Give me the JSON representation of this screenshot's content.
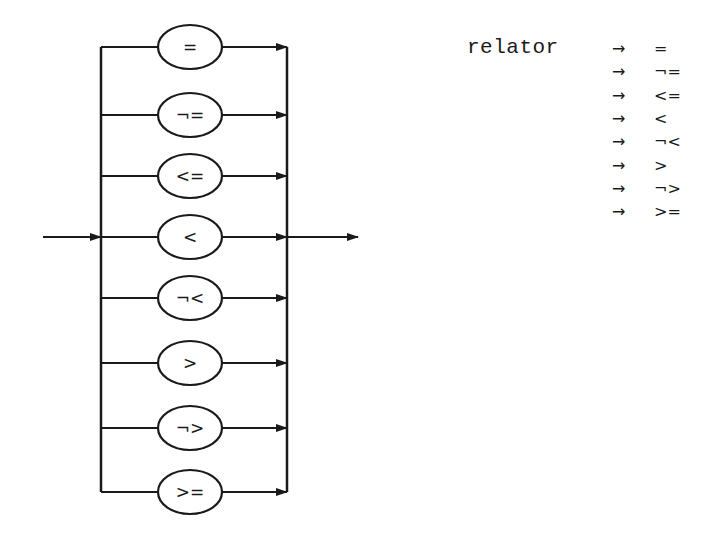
{
  "diagram": {
    "stroke_color": "#1a1a1a",
    "background": "#ffffff",
    "entry_arrow": {
      "from_x": 43,
      "to_x": 101,
      "y": 237
    },
    "exit_arrow": {
      "from_x": 287,
      "to_x": 358,
      "y": 237
    },
    "left_rail_x": 101,
    "right_rail_x": 287,
    "branches": [
      {
        "label": "=",
        "y": 47
      },
      {
        "label": "¬=",
        "y": 115
      },
      {
        "label": "<=",
        "y": 176
      },
      {
        "label": "<",
        "y": 237
      },
      {
        "label": "¬<",
        "y": 298
      },
      {
        "label": ">",
        "y": 363
      },
      {
        "label": "¬>",
        "y": 428
      },
      {
        "label": ">=",
        "y": 492
      }
    ]
  },
  "grammar": {
    "nonterminal": "relator",
    "arrow_symbol": "→",
    "productions": [
      "=",
      "¬=",
      "<=",
      "<",
      "¬<",
      ">",
      "¬>",
      ">="
    ]
  }
}
